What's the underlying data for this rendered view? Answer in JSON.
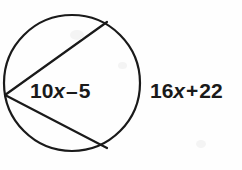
{
  "figure": {
    "background_color": "#fefefe",
    "stroke_color": "#1a1a1a",
    "text_color": "#1a1a1a",
    "circle": {
      "center_x": 72,
      "center_y": 83,
      "radius": 68,
      "stroke_width": 2.2
    },
    "vertex": {
      "x": 5,
      "y": 95,
      "label": "common-vertex-on-circle"
    },
    "chords": [
      {
        "name": "upper-chord",
        "x1": 5,
        "y1": 95,
        "x2": 107,
        "y2": 22,
        "stroke_width": 2.2
      },
      {
        "name": "lower-chord",
        "x1": 5,
        "y1": 95,
        "x2": 107,
        "y2": 148,
        "stroke_width": 2.2
      }
    ]
  },
  "labels": {
    "inner": {
      "name": "inscribed-angle-expression",
      "full_text": "10x - 5",
      "coefficient": "10",
      "variable": "x",
      "operator": "–",
      "constant": "5",
      "position": "inside-circle"
    },
    "outer": {
      "name": "intercepted-arc-expression",
      "full_text": "16x + 22",
      "coefficient": "16",
      "variable": "x",
      "operator": "+",
      "constant": "22",
      "position": "outside-circle-right"
    }
  }
}
